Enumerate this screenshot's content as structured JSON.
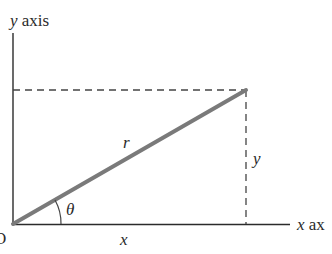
{
  "diagram": {
    "y_axis_label_var": "y",
    "y_axis_label_word": "axis",
    "x_axis_label_var": "x",
    "x_axis_label_word": "ax",
    "origin_label": "O",
    "radius_label": "r",
    "angle_label": "θ",
    "x_component_label": "x",
    "y_component_label": "y",
    "colors": {
      "axis": "#2b2b2b",
      "vector": "#7a7a7a",
      "dashed": "#444444",
      "text": "#2a2a2a"
    }
  }
}
